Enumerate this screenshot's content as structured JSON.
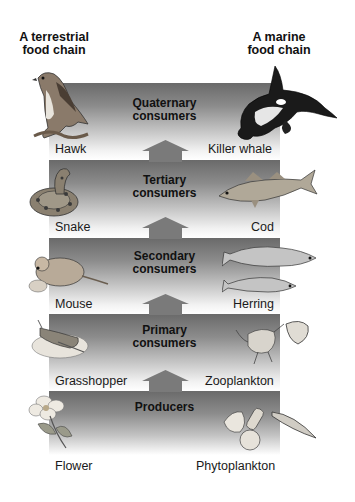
{
  "headers": {
    "terrestrial": "A terrestrial\nfood chain",
    "terrestrial_line1": "A terrestrial",
    "terrestrial_line2": "food chain",
    "marine_line1": "A marine",
    "marine_line2": "food chain"
  },
  "levels": [
    {
      "title_line1": "Quaternary",
      "title_line2": "consumers",
      "terrestrial": "Hawk",
      "marine": "Killer whale"
    },
    {
      "title_line1": "Tertiary",
      "title_line2": "consumers",
      "terrestrial": "Snake",
      "marine": "Cod"
    },
    {
      "title_line1": "Secondary",
      "title_line2": "consumers",
      "terrestrial": "Mouse",
      "marine": "Herring"
    },
    {
      "title_line1": "Primary",
      "title_line2": "consumers",
      "terrestrial": "Grasshopper",
      "marine": "Zooplankton"
    },
    {
      "title_line1": "Producers",
      "title_line2": "",
      "terrestrial": "Flower",
      "marine": "Phytoplankton"
    }
  ],
  "colors": {
    "band_dark": "#6a6a6a",
    "band_light": "#ffffff",
    "arrow": "#7a7a7a",
    "text": "#111111"
  }
}
